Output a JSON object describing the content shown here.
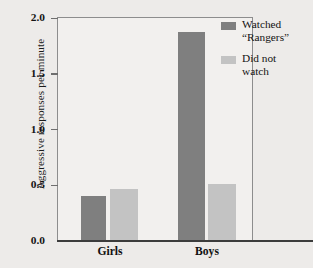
{
  "chart_data": {
    "type": "bar",
    "title": "",
    "xlabel": "",
    "ylabel": "Aggressive responses per minute",
    "categories": [
      "Girls",
      "Boys"
    ],
    "series": [
      {
        "name": "Watched \"Rangers\"",
        "color": "#7f7f7f",
        "values": [
          0.4,
          1.87
        ]
      },
      {
        "name": "Did not watch",
        "color": "#c3c3c3",
        "values": [
          0.46,
          0.5
        ]
      }
    ],
    "ylim": [
      0.0,
      2.0
    ],
    "ytick_labels": [
      "2.0",
      "1.5",
      "1.0",
      "0.5",
      "0.0"
    ],
    "ytick_values": [
      2.0,
      1.5,
      1.0,
      0.5,
      0.0
    ],
    "grid": false,
    "legend_position": "top-right"
  },
  "legend": {
    "entries": [
      {
        "label": "Watched\n“Rangers”",
        "color": "#7f7f7f"
      },
      {
        "label": "Did not\nwatch",
        "color": "#c3c3c3"
      }
    ]
  },
  "axes": {
    "y_title": "Aggressive responses per minute",
    "x_categories": [
      "Girls",
      "Boys"
    ]
  },
  "colors": {
    "background": "#edebe9",
    "plot_background": "#f2f0ee",
    "frame": "#8d8d8d",
    "baseline": "#3c3c3c",
    "bar_dark": "#7f7f7f",
    "bar_light": "#c3c3c3",
    "text": "#131313"
  }
}
